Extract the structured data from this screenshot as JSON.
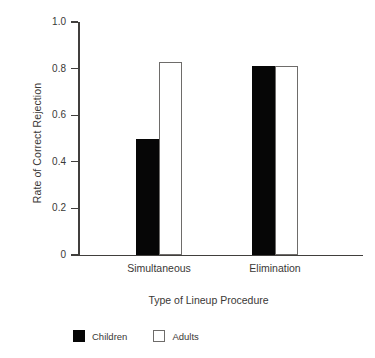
{
  "chart_data": {
    "type": "bar",
    "title": "",
    "xlabel": "Type of Lineup Procedure",
    "ylabel": "Rate of Correct Rejection",
    "categories": [
      "Simultaneous",
      "Elimination"
    ],
    "series": [
      {
        "name": "Children",
        "values": [
          0.5,
          0.81
        ],
        "color": "#060606",
        "style": "filled"
      },
      {
        "name": "Adults",
        "values": [
          0.83,
          0.81
        ],
        "color": "#ffffff",
        "style": "outlined"
      }
    ],
    "ylim": [
      0,
      1.0
    ],
    "yticks": [
      0,
      0.2,
      0.4,
      0.6,
      0.8,
      1.0
    ],
    "ytick_labels": [
      "0",
      "0.2",
      "0.4",
      "0.6",
      "0.8",
      "1.0"
    ],
    "grid": false,
    "legend_position": "bottom-left",
    "legend_entries": [
      "Children",
      "Adults"
    ]
  },
  "axes": {
    "y_title": "Rate of Correct Rejection",
    "x_title": "Type of Lineup Procedure",
    "axis_color": "#413f3d"
  }
}
